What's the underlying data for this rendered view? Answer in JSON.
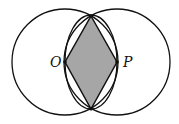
{
  "diagram": {
    "type": "geometry",
    "points": {
      "O": {
        "label": "O",
        "x": 65,
        "y": 62
      },
      "P": {
        "label": "P",
        "x": 117,
        "y": 62
      },
      "top_intersection": {
        "x": 91,
        "y": 16
      },
      "bottom_intersection": {
        "x": 91,
        "y": 109
      }
    },
    "circles": [
      {
        "name": "circle-O",
        "cx": 65,
        "cy": 62,
        "r": 53
      },
      {
        "name": "circle-P",
        "cx": 117,
        "cy": 62,
        "r": 53
      },
      {
        "name": "middle-circle",
        "cx": 91,
        "cy": 62,
        "r": 47
      }
    ],
    "shaded_region": {
      "shape": "rhombus",
      "fill": "#a6a6a6"
    },
    "stroke_color": "#111111"
  }
}
